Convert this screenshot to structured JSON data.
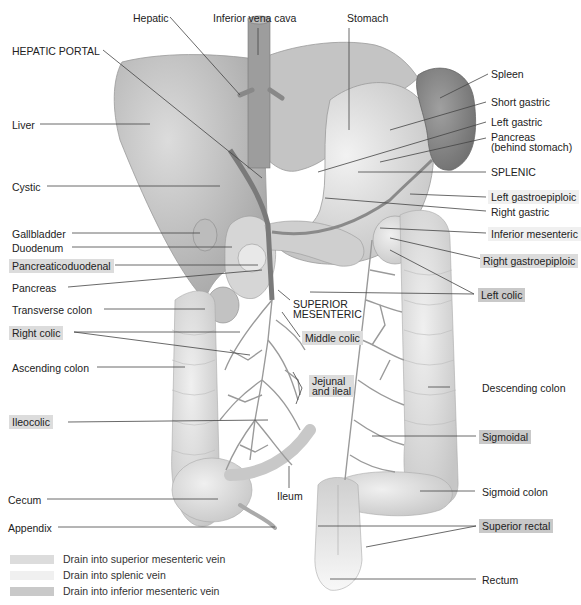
{
  "figure": {
    "colors": {
      "superior_mesenteric_highlight": "#dcdcdc",
      "splenic_highlight": "#f0f0f0",
      "inferior_mesenteric_highlight": "#c9c9c9",
      "organ_fill": "#d9d9d9",
      "vessel_stroke": "#8a8a8a",
      "leader_line": "#444444"
    }
  },
  "labels": {
    "hepatic": "Hepatic",
    "inferior_vena_cava": "Inferior vena cava",
    "stomach": "Stomach",
    "hepatic_portal": "HEPATIC PORTAL",
    "spleen": "Spleen",
    "short_gastric": "Short gastric",
    "left_gastric": "Left gastric",
    "pancreas_behind_stomach_1": "Pancreas",
    "pancreas_behind_stomach_2": "(behind stomach)",
    "liver": "Liver",
    "splenic": "SPLENIC",
    "cystic": "Cystic",
    "left_gastroepiploic": "Left gastroepiploic",
    "right_gastric": "Right gastric",
    "gallbladder": "Gallbladder",
    "duodenum": "Duodenum",
    "inferior_mesenteric": "Inferior mesenteric",
    "pancreaticoduodenal": "Pancreaticoduodenal",
    "right_gastroepiploic": "Right gastroepiploic",
    "pancreas": "Pancreas",
    "left_colic": "Left colic",
    "superior_mesenteric_1": "SUPERIOR",
    "superior_mesenteric_2": "MESENTERIC",
    "transverse_colon": "Transverse colon",
    "middle_colic": "Middle colic",
    "right_colic": "Right colic",
    "ascending_colon": "Ascending colon",
    "jejunal_1": "Jejunal",
    "jejunal_2": "and ileal",
    "descending_colon": "Descending colon",
    "ileocolic": "Ileocolic",
    "sigmoidal": "Sigmoidal",
    "ileum": "Ileum",
    "cecum": "Cecum",
    "sigmoid_colon": "Sigmoid colon",
    "appendix": "Appendix",
    "superior_rectal": "Superior rectal",
    "rectum": "Rectum"
  },
  "legend": {
    "items": [
      {
        "label": "Drain into superior mesenteric vein",
        "color": "#dcdcdc"
      },
      {
        "label": "Drain into splenic vein",
        "color": "#f0f0f0"
      },
      {
        "label": "Drain into inferior mesenteric vein",
        "color": "#c9c9c9"
      }
    ]
  }
}
